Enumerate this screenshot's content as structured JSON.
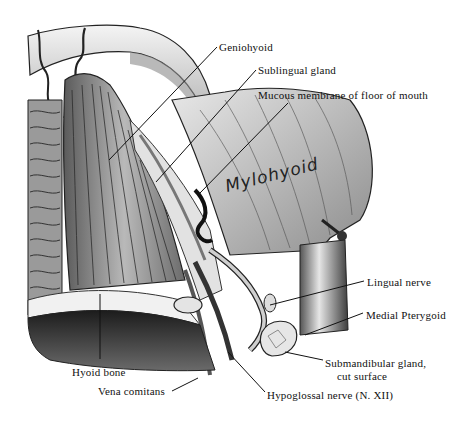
{
  "figure": {
    "style": "monochrome engraving",
    "colors": {
      "background": "#ffffff",
      "ink": "#111111",
      "shadow": "#3a3a3a",
      "mid": "#8a8a8a",
      "light": "#d8d8d8"
    }
  },
  "labels": [
    {
      "id": "geniohyoid",
      "text": "Geniohyoid",
      "x": 219,
      "y": 41,
      "leader": [
        217,
        47,
        109,
        160
      ]
    },
    {
      "id": "sublingual-gland",
      "text": "Sublingual gland",
      "x": 258,
      "y": 64,
      "leader": [
        256,
        70,
        156,
        182
      ]
    },
    {
      "id": "mucous-membrane",
      "text": "Mucous membrane of floor of mouth",
      "x": 258,
      "y": 89,
      "leader": [
        288,
        103,
        200,
        193
      ]
    },
    {
      "id": "lingual-nerve",
      "text": "Lingual nerve",
      "x": 367,
      "y": 276,
      "leader": [
        364,
        281,
        270,
        305
      ]
    },
    {
      "id": "medial-pterygoid",
      "text": "Medial Pterygoid",
      "x": 366,
      "y": 309,
      "leader": [
        363,
        313,
        305,
        335
      ]
    },
    {
      "id": "submandibular-gland",
      "text": "Submandibular gland,",
      "text2": "cut surface",
      "x": 325,
      "y": 357,
      "leader": [
        323,
        360,
        285,
        352
      ]
    },
    {
      "id": "hyoid-bone",
      "text": "Hyoid bone",
      "x": 72,
      "y": 366,
      "leader": [
        100,
        359,
        100,
        294
      ]
    },
    {
      "id": "vena-comitans",
      "text": "Vena comitans",
      "x": 98,
      "y": 390,
      "leader": [
        172,
        391,
        198,
        378
      ]
    },
    {
      "id": "hypoglossal-nerve",
      "text": "Hypoglossal nerve (N. XII)",
      "x": 267,
      "y": 391,
      "leader": [
        265,
        392,
        228,
        352
      ]
    }
  ],
  "annotations": {
    "handwritten": "Mylohyoid",
    "margin_note": "M.TOV"
  }
}
